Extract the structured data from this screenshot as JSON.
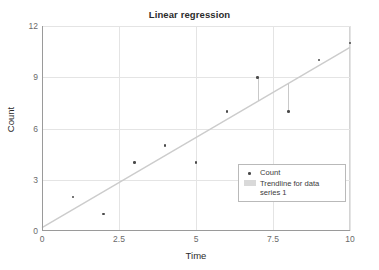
{
  "chart_data": {
    "type": "scatter",
    "title": "Linear regression",
    "xlabel": "Time",
    "ylabel": "Count",
    "xlim": [
      0,
      10
    ],
    "ylim": [
      0,
      12
    ],
    "x_ticks": [
      "0",
      "2.5",
      "5",
      "7.5",
      "10"
    ],
    "x_tick_values": [
      0,
      2.5,
      5,
      7.5,
      10
    ],
    "y_ticks": [
      "0",
      "3",
      "6",
      "9",
      "12"
    ],
    "y_tick_values": [
      0,
      3,
      6,
      9,
      12
    ],
    "grid": true,
    "legend_position": "inside-bottom-right",
    "series": [
      {
        "name": "Count",
        "type": "scatter",
        "marker": "dot",
        "color": "#4a4a4a",
        "x": [
          1,
          2,
          3,
          4,
          5,
          6,
          7,
          8,
          9,
          10
        ],
        "values": [
          2,
          1,
          4,
          5,
          4,
          7,
          9,
          7,
          10,
          11
        ]
      },
      {
        "name": "Trendline for data series 1",
        "type": "line",
        "color": "#cccccc",
        "endpoints": [
          [
            0,
            0.2
          ],
          [
            10,
            10.75
          ]
        ],
        "residuals_shown_at_x": [
          7,
          8
        ]
      }
    ],
    "legend": [
      {
        "label": "Count",
        "key": "dot-marker",
        "color": "#4a4a4a"
      },
      {
        "label": "Trendline for data series 1",
        "key": "line-swatch",
        "color": "#d9d9d9"
      }
    ]
  },
  "colors": {
    "background": "#ffffff",
    "axis": "#9a9a9a",
    "grid": "#e4e4e4",
    "frame": "#d4d4d4",
    "point": "#4a4a4a",
    "trendline": "#cccccc",
    "text": "#2b2b2b",
    "tick_text": "#6a6a6a"
  }
}
